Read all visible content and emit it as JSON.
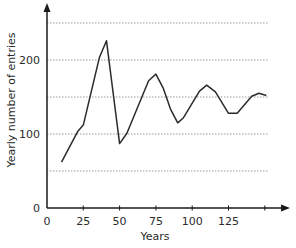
{
  "chart_data": {
    "type": "line",
    "title": "",
    "xlabel": "Years",
    "ylabel": "Yearly number of entries",
    "xlim": [
      0,
      165
    ],
    "ylim": [
      0,
      275
    ],
    "x_ticks": [
      0,
      25,
      50,
      75,
      100,
      125,
      150
    ],
    "x_tick_labels": [
      "0",
      "25",
      "50",
      "75",
      "100",
      "125",
      ""
    ],
    "y_ticks": [
      0,
      100,
      200
    ],
    "y_tick_labels": [
      "0",
      "100",
      "200"
    ],
    "gridlines_y": [
      50,
      100,
      150,
      200,
      250
    ],
    "grid": true,
    "legend": null,
    "series": [
      {
        "name": "Yearly number of entries",
        "color": "#2b2b2b",
        "x": [
          10,
          21,
          25,
          36,
          41,
          50,
          55,
          70,
          75,
          80,
          85,
          90,
          94,
          105,
          110,
          116,
          125,
          131,
          141,
          146,
          151
        ],
        "values": [
          62,
          103,
          112,
          203,
          226,
          87,
          101,
          172,
          181,
          162,
          134,
          115,
          122,
          158,
          166,
          157,
          128,
          128,
          151,
          155,
          152
        ]
      }
    ]
  },
  "colors": {
    "axis": "#1a1a1a",
    "line": "#2b2b2b",
    "grid": "#9a9a9a"
  }
}
